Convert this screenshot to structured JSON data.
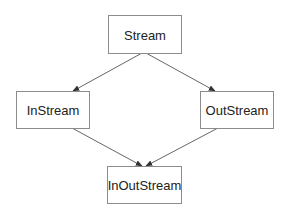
{
  "diagram": {
    "type": "inheritance-graph",
    "colors": {
      "background": "#ffffff",
      "node_border": "#8c8c8c",
      "node_fill": "#ffffff",
      "text": "#222222",
      "edge": "#666666"
    },
    "nodes": [
      {
        "id": "stream",
        "label": "Stream",
        "x": 108,
        "y": 15,
        "w": 73,
        "h": 38
      },
      {
        "id": "instream",
        "label": "InStream",
        "x": 16,
        "y": 91,
        "w": 73,
        "h": 37
      },
      {
        "id": "outstream",
        "label": "OutStream",
        "x": 200,
        "y": 91,
        "w": 73,
        "h": 37
      },
      {
        "id": "inoutstream",
        "label": "InOutStream",
        "x": 107,
        "y": 166,
        "w": 74,
        "h": 37
      }
    ],
    "edges": [
      {
        "from": "stream",
        "to": "instream",
        "x1": 142,
        "y1": 53,
        "x2": 73,
        "y2": 91
      },
      {
        "from": "stream",
        "to": "outstream",
        "x1": 146,
        "y1": 53,
        "x2": 215,
        "y2": 91
      },
      {
        "from": "instream",
        "to": "inoutstream",
        "x1": 72,
        "y1": 128,
        "x2": 142,
        "y2": 166
      },
      {
        "from": "outstream",
        "to": "inoutstream",
        "x1": 218,
        "y1": 128,
        "x2": 146,
        "y2": 166
      }
    ]
  }
}
